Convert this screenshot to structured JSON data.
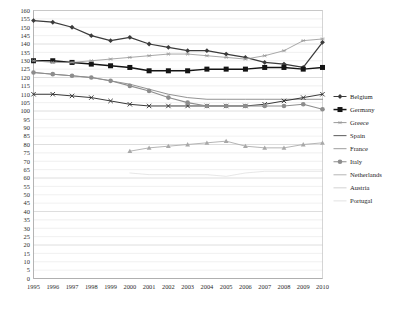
{
  "chart_data": {
    "type": "line",
    "title": "",
    "subtitle": "",
    "xlabel": "",
    "ylabel": "",
    "xlim": [
      1995,
      2010
    ],
    "ylim": [
      0,
      160
    ],
    "ytick_step": 5,
    "grid": true,
    "legend_position": "right",
    "categories": [
      1995,
      1996,
      1997,
      1998,
      1999,
      2000,
      2001,
      2002,
      2003,
      2004,
      2005,
      2006,
      2007,
      2008,
      2009,
      2010
    ],
    "x": [
      "1995",
      "1996",
      "1997",
      "1998",
      "1999",
      "2000",
      "2001",
      "2002",
      "2003",
      "2004",
      "2005",
      "2006",
      "2007",
      "2008",
      "2009",
      "2010"
    ],
    "yticks": [
      "0",
      "5",
      "10",
      "15",
      "20",
      "25",
      "30",
      "35",
      "40",
      "45",
      "50",
      "55",
      "60",
      "65",
      "70",
      "75",
      "80",
      "85",
      "90",
      "95",
      "100",
      "105",
      "110",
      "115",
      "120",
      "125",
      "130",
      "135",
      "140",
      "145",
      "150",
      "155",
      "160"
    ],
    "series": [
      {
        "name": "Belgium",
        "marker": "diamond",
        "color": "#3b3b3b",
        "width": 1.25,
        "values": [
          154,
          153,
          150,
          145,
          142,
          144,
          140,
          138,
          136,
          136,
          134,
          132,
          129,
          128,
          126,
          141
        ]
      },
      {
        "name": "Germany",
        "marker": "square",
        "color": "#141414",
        "width": 1.5,
        "values": [
          130,
          130,
          129,
          128,
          127,
          126,
          124,
          124,
          124,
          125,
          125,
          125,
          126,
          126,
          125,
          126
        ]
      },
      {
        "name": "Greece",
        "marker": "asterisk",
        "color": "#9a9a9a",
        "width": 0.85,
        "values": [
          130,
          129,
          129,
          130,
          131,
          132,
          133,
          134,
          134,
          133,
          132,
          131,
          133,
          136,
          142,
          143
        ]
      },
      {
        "name": "Spain",
        "marker": "none",
        "color": "#777777",
        "width": 0.8,
        "values": [
          123,
          122,
          121,
          120,
          118,
          116,
          113,
          110,
          108,
          107,
          107,
          107,
          107,
          107,
          107,
          107
        ]
      },
      {
        "name": "France",
        "marker": "x",
        "color": "#2e2e2e",
        "width": 0.95,
        "values": [
          110,
          110,
          109,
          108,
          106,
          104,
          103,
          103,
          103,
          103,
          103,
          103,
          104,
          106,
          108,
          110
        ]
      },
      {
        "name": "Italy",
        "marker": "circle",
        "color": "#8d8d8d",
        "width": 1.05,
        "values": [
          123,
          122,
          121,
          120,
          118,
          115,
          112,
          108,
          105,
          103,
          103,
          103,
          103,
          103,
          104,
          101
        ]
      },
      {
        "name": "Netherlands",
        "marker": "triangle",
        "color": "#a8a8a8",
        "width": 0.85,
        "values": [
          null,
          null,
          null,
          null,
          null,
          76,
          78,
          79,
          80,
          81,
          82,
          79,
          78,
          78,
          80,
          81
        ]
      },
      {
        "name": "Austria",
        "marker": "none",
        "color": "#dcdcdc",
        "width": 0.7,
        "values": [
          null,
          null,
          null,
          null,
          null,
          63,
          62,
          62,
          62,
          62,
          61,
          63,
          64,
          64,
          64,
          64
        ]
      },
      {
        "name": "Portugal",
        "marker": "none",
        "color": "#efefef",
        "width": 0.65,
        "values": [
          null,
          null,
          null,
          null,
          null,
          null,
          null,
          null,
          null,
          null,
          null,
          null,
          null,
          null,
          null,
          null
        ]
      }
    ],
    "legend": [
      {
        "label": "Belgium",
        "marker": "diamond",
        "color": "#3b3b3b"
      },
      {
        "label": "Germany",
        "marker": "square",
        "color": "#141414"
      },
      {
        "label": "Greece",
        "marker": "asterisk",
        "color": "#9a9a9a"
      },
      {
        "label": "Spain",
        "marker": "none",
        "color": "#5a5a5a"
      },
      {
        "label": "France",
        "marker": "none",
        "color": "#9d9d9d"
      },
      {
        "label": "Italy",
        "marker": "circle",
        "color": "#8d8d8d"
      },
      {
        "label": "Netherlands",
        "marker": "none",
        "color": "#b5b5b5"
      },
      {
        "label": "Austria",
        "marker": "none",
        "color": "#d2d2d2"
      },
      {
        "label": "Portugal",
        "marker": "none",
        "color": "#e2e2e2"
      }
    ]
  }
}
